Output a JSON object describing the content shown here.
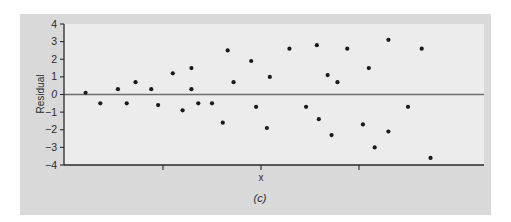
{
  "chart_data": {
    "type": "scatter",
    "title": "",
    "caption": "(c)",
    "xlabel": "x",
    "ylabel": "Residual",
    "ylim": [
      -4,
      4
    ],
    "yticks": [
      4,
      3,
      2,
      1,
      0,
      -1,
      -2,
      -3,
      -4
    ],
    "ytick_labels": [
      "4",
      "3",
      "2",
      "1",
      "0",
      "−1",
      "−2",
      "−3",
      "−4"
    ],
    "xticks": [
      1,
      2,
      3
    ],
    "xtick_labels": [
      "",
      "",
      ""
    ],
    "xlim": [
      0,
      4.3
    ],
    "reference_line": {
      "y": 0,
      "label": "zero residual line"
    },
    "grid": false,
    "legend": null,
    "points": [
      {
        "x": 0.21,
        "y": 0.1
      },
      {
        "x": 0.36,
        "y": -0.5
      },
      {
        "x": 0.54,
        "y": 0.3
      },
      {
        "x": 0.63,
        "y": -0.5
      },
      {
        "x": 0.72,
        "y": 0.7
      },
      {
        "x": 0.88,
        "y": 0.3
      },
      {
        "x": 0.95,
        "y": -0.6
      },
      {
        "x": 1.1,
        "y": 1.2
      },
      {
        "x": 1.2,
        "y": -0.9
      },
      {
        "x": 1.29,
        "y": 1.5
      },
      {
        "x": 1.29,
        "y": 0.3
      },
      {
        "x": 1.36,
        "y": -0.5
      },
      {
        "x": 1.5,
        "y": -0.5
      },
      {
        "x": 1.61,
        "y": -1.6
      },
      {
        "x": 1.66,
        "y": 2.5
      },
      {
        "x": 1.72,
        "y": 0.7
      },
      {
        "x": 1.9,
        "y": 1.9
      },
      {
        "x": 1.95,
        "y": -0.7
      },
      {
        "x": 2.06,
        "y": -1.9
      },
      {
        "x": 2.09,
        "y": 1.0
      },
      {
        "x": 2.29,
        "y": 2.6
      },
      {
        "x": 2.46,
        "y": -0.7
      },
      {
        "x": 2.57,
        "y": 2.8
      },
      {
        "x": 2.59,
        "y": -1.4
      },
      {
        "x": 2.68,
        "y": 1.1
      },
      {
        "x": 2.72,
        "y": -2.3
      },
      {
        "x": 2.78,
        "y": 0.7
      },
      {
        "x": 2.88,
        "y": 2.6
      },
      {
        "x": 3.04,
        "y": -1.7
      },
      {
        "x": 3.1,
        "y": 1.5
      },
      {
        "x": 3.16,
        "y": -3.0
      },
      {
        "x": 3.3,
        "y": -2.1
      },
      {
        "x": 3.3,
        "y": 3.1
      },
      {
        "x": 3.5,
        "y": -0.7
      },
      {
        "x": 3.64,
        "y": 2.6
      },
      {
        "x": 3.73,
        "y": -3.6
      }
    ]
  },
  "colors": {
    "figure_bg": "#d9d9d9",
    "plot_bg": "#ececec",
    "axis": "#2a2a2a",
    "zero_line": "#6e6e6e",
    "point": "#1a1a1a"
  }
}
